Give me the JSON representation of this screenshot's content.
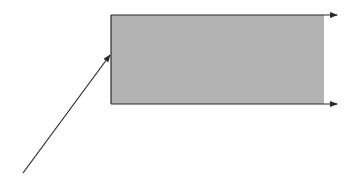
{
  "diagram": {
    "width": 353,
    "height": 185,
    "background": "#ffffff",
    "colors": {
      "fill": "#b3b3b3",
      "stroke": "#2a2a2a"
    },
    "rectangle": {
      "x": 111,
      "y": 15,
      "width": 213,
      "height": 89
    },
    "arrows": [
      {
        "name": "top-edge-arrow",
        "x1": 111,
        "y1": 15,
        "x2": 337,
        "y2": 15
      },
      {
        "name": "bottom-edge-arrow",
        "x1": 111,
        "y1": 104,
        "x2": 337,
        "y2": 104
      },
      {
        "name": "diagonal-pointer-arrow",
        "x1": 23,
        "y1": 173,
        "x2": 110,
        "y2": 55
      }
    ],
    "labels": []
  }
}
